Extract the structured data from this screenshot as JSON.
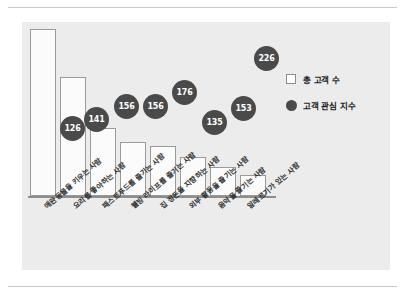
{
  "chart_data": {
    "type": "bar",
    "title": "",
    "subtitle": "",
    "xlabel": "",
    "ylabel": "",
    "grid": false,
    "legend_position": "top-right",
    "categories": [
      "애완동물을 키우는 사람",
      "요리를 좋아하는 사람",
      "패스트푸드를 즐기는 사람",
      "웰빙 라이프를 즐기는 사람",
      "집 정돈을 지향하는 사람",
      "외부 활동을 즐기는 사람",
      "음악을 즐기는 사람",
      "알레르기가 있는 사람"
    ],
    "series": [
      {
        "name": "총 고객 수",
        "type": "bar",
        "values": [
          167,
          119,
          68,
          54,
          50,
          39,
          29,
          21
        ]
      },
      {
        "name": "고객 관심 지수",
        "type": "scatter",
        "values": [
          126,
          141,
          156,
          156,
          176,
          135,
          153,
          226
        ]
      }
    ]
  },
  "legend": {
    "items": [
      {
        "label": "총 고객 수",
        "marker": "square-outline",
        "color": "#ffffff"
      },
      {
        "label": "고객 관심 지수",
        "marker": "filled-circle",
        "color": "#4a4a4a"
      }
    ]
  },
  "bubbles": [
    {
      "value": "126",
      "left": 38,
      "top": 94,
      "size": 25
    },
    {
      "value": "141",
      "left": 62,
      "top": 85,
      "size": 25
    },
    {
      "value": "156",
      "left": 92,
      "top": 72,
      "size": 25
    },
    {
      "value": "156",
      "left": 121,
      "top": 72,
      "size": 25
    },
    {
      "value": "176",
      "left": 150,
      "top": 58,
      "size": 25
    },
    {
      "value": "135",
      "left": 180,
      "top": 88,
      "size": 25
    },
    {
      "value": "153",
      "left": 209,
      "top": 74,
      "size": 25
    },
    {
      "value": "226",
      "left": 232,
      "top": 24,
      "size": 25
    }
  ],
  "bars": [
    {
      "left": 0,
      "width": 26,
      "height": 167
    },
    {
      "left": 30,
      "width": 26,
      "height": 119
    },
    {
      "left": 60,
      "width": 26,
      "height": 68
    },
    {
      "left": 90,
      "width": 26,
      "height": 54
    },
    {
      "left": 120,
      "width": 26,
      "height": 50
    },
    {
      "left": 150,
      "width": 26,
      "height": 39
    },
    {
      "left": 180,
      "width": 26,
      "height": 29
    },
    {
      "left": 210,
      "width": 26,
      "height": 21
    }
  ],
  "label_positions": [
    {
      "left": 20,
      "top": 181
    },
    {
      "left": 49,
      "top": 181
    },
    {
      "left": 78,
      "top": 181
    },
    {
      "left": 107,
      "top": 181
    },
    {
      "left": 136,
      "top": 181
    },
    {
      "left": 165,
      "top": 181
    },
    {
      "left": 194,
      "top": 181
    },
    {
      "left": 223,
      "top": 181
    }
  ],
  "colors": {
    "panel_background": "#ececec",
    "bar_fill": "#fbfbfb",
    "bar_stroke": "#9a9a9a",
    "bubble_fill": "#4a4a4a",
    "bubble_text": "#ffffff",
    "axis": "#8d8d8d",
    "rule": "#c9c9c9"
  }
}
